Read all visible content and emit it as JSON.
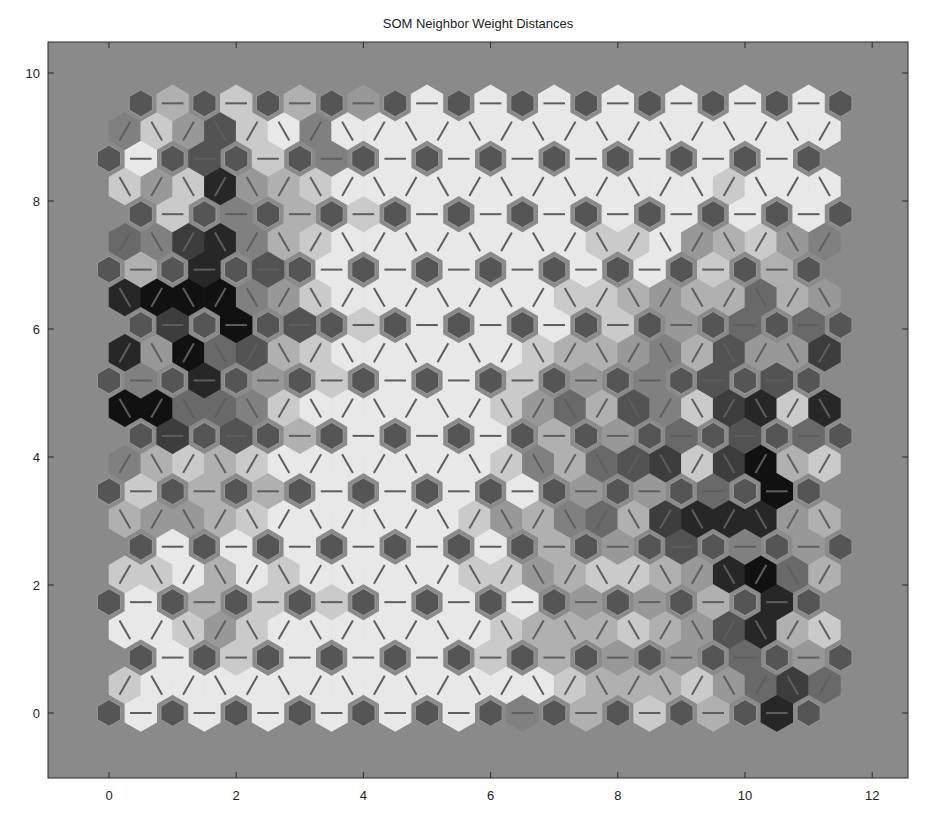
{
  "chart_data": {
    "type": "heatmap",
    "subtype": "som-neighbor-weight-distances",
    "title": "SOM Neighbor Weight Distances",
    "xlabel": "",
    "ylabel": "",
    "xlim": [
      -1,
      12.6
    ],
    "ylim": [
      -1.1,
      10.5
    ],
    "xticks": [
      0,
      2,
      4,
      6,
      8,
      10,
      12
    ],
    "yticks": [
      0,
      2,
      4,
      6,
      8,
      10
    ],
    "grid": false,
    "legend": null,
    "topology": {
      "type": "hextop",
      "rows": 12,
      "cols": 12,
      "row_spacing": 0.866,
      "odd_row_offset": 0.5
    },
    "shade_scale": {
      "min": 0,
      "max": 9,
      "note": "0 = small distance (light), 9 = large distance (dark)"
    },
    "horizontal_edge_distances": [
      [
        0,
        0,
        0,
        0,
        0,
        0,
        4,
        2,
        1,
        2,
        8
      ],
      [
        0,
        1,
        0,
        0,
        0,
        1,
        2,
        3,
        3,
        5,
        3
      ],
      [
        0,
        2,
        1,
        1,
        0,
        0,
        0,
        3,
        3,
        2,
        8
      ],
      [
        0,
        0,
        0,
        0,
        0,
        0,
        2,
        3,
        6,
        4,
        3
      ],
      [
        1,
        2,
        2,
        0,
        0,
        0,
        0,
        3,
        3,
        5,
        9
      ],
      [
        7,
        6,
        2,
        0,
        0,
        0,
        2,
        3,
        5,
        6,
        5
      ],
      [
        4,
        8,
        3,
        1,
        0,
        0,
        1,
        3,
        4,
        6,
        6
      ],
      [
        7,
        9,
        6,
        1,
        0,
        0,
        0,
        1,
        3,
        5,
        5
      ],
      [
        2,
        8,
        6,
        0,
        0,
        0,
        0,
        0,
        0,
        1,
        2
      ],
      [
        1,
        4,
        2,
        1,
        0,
        0,
        0,
        0,
        0,
        0,
        0
      ],
      [
        0,
        6,
        1,
        4,
        0,
        0,
        0,
        0,
        0,
        0,
        0
      ],
      [
        2,
        1,
        2,
        3,
        0,
        0,
        0,
        0,
        0,
        0,
        0
      ]
    ],
    "diagonal_edge_distances": [
      [
        1,
        0,
        0,
        0,
        0,
        0,
        0,
        0,
        0,
        0,
        0,
        0,
        0,
        0,
        1,
        2,
        2,
        2,
        1,
        3,
        5,
        7,
        5
      ],
      [
        0,
        0,
        1,
        3,
        1,
        0,
        0,
        0,
        0,
        0,
        0,
        0,
        1,
        2,
        2,
        2,
        1,
        2,
        3,
        6,
        8,
        2,
        1
      ],
      [
        1,
        1,
        0,
        2,
        0,
        1,
        0,
        0,
        0,
        0,
        0,
        1,
        1,
        3,
        2,
        1,
        1,
        2,
        3,
        8,
        9,
        5,
        2
      ],
      [
        2,
        3,
        3,
        2,
        1,
        0,
        0,
        0,
        0,
        0,
        0,
        1,
        3,
        2,
        4,
        5,
        2,
        7,
        8,
        8,
        8,
        3,
        2
      ],
      [
        4,
        2,
        1,
        2,
        1,
        0,
        0,
        0,
        0,
        0,
        0,
        0,
        1,
        4,
        2,
        5,
        6,
        7,
        1,
        7,
        9,
        2,
        1
      ],
      [
        9,
        9,
        5,
        5,
        4,
        1,
        0,
        0,
        0,
        0,
        0,
        0,
        1,
        3,
        5,
        2,
        6,
        4,
        1,
        7,
        8,
        1,
        8
      ],
      [
        8,
        3,
        9,
        5,
        6,
        2,
        1,
        0,
        0,
        0,
        0,
        0,
        0,
        1,
        2,
        2,
        3,
        4,
        2,
        6,
        3,
        3,
        7
      ],
      [
        8,
        9,
        9,
        9,
        4,
        3,
        1,
        0,
        0,
        0,
        0,
        0,
        0,
        0,
        1,
        1,
        2,
        3,
        2,
        2,
        5,
        2,
        3
      ],
      [
        5,
        4,
        7,
        8,
        4,
        2,
        1,
        0,
        0,
        0,
        0,
        0,
        0,
        0,
        0,
        1,
        1,
        0,
        3,
        2,
        1,
        3,
        4
      ],
      [
        1,
        3,
        1,
        8,
        3,
        2,
        1,
        0,
        0,
        0,
        0,
        0,
        0,
        0,
        0,
        0,
        0,
        0,
        0,
        1,
        0,
        0,
        0
      ],
      [
        4,
        1,
        3,
        6,
        1,
        0,
        4,
        0,
        0,
        0,
        0,
        0,
        0,
        0,
        0,
        0,
        0,
        0,
        0,
        0,
        0,
        0,
        0
      ]
    ]
  },
  "colors": {
    "axes_background": "#8a8a8a",
    "figure_background": "#ffffff",
    "neuron_fill": "#555555",
    "neuron_outline": "#9a9a9a",
    "edge_line": "#5e5e5e",
    "light_patch": "#e8e8e8",
    "dark_patch": "#111111",
    "axis_frame": "#2a2a2a"
  }
}
